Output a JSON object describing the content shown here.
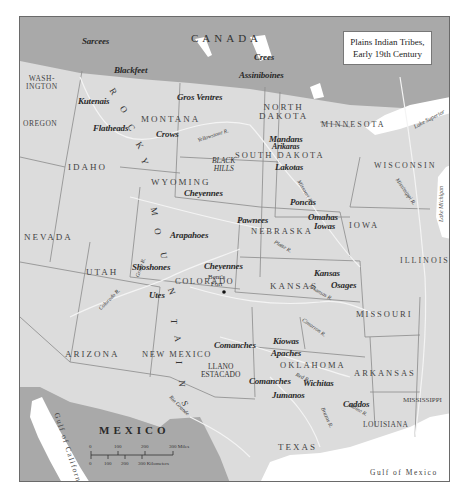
{
  "title": {
    "line1": "Plains Indian Tribes,",
    "line2": "Early 19th Century"
  },
  "countries": {
    "canada": "CANADA",
    "mexico": "MEXICO"
  },
  "states": {
    "washington_1": "WASH-",
    "washington_2": "INGTON",
    "oregon": "OREGON",
    "idaho": "IDAHO",
    "montana": "MONTANA",
    "north_dakota_1": "NORTH",
    "north_dakota_2": "DAKOTA",
    "south_dakota": "SOUTH DAKOTA",
    "minnesota": "MINNESOTA",
    "wisconsin": "WISCONSIN",
    "wyoming": "WYOMING",
    "nebraska": "NEBRASKA",
    "iowa": "IOWA",
    "illinois": "ILLINOIS",
    "nevada": "NEVADA",
    "utah": "UTAH",
    "colorado": "COLORADO",
    "kansas": "KANSAS",
    "missouri": "MISSOURI",
    "arizona": "ARIZONA",
    "new_mexico": "NEW MEXICO",
    "oklahoma": "OKLAHOMA",
    "arkansas": "ARKANSAS",
    "mississippi": "MISSISSIPPI",
    "louisiana": "LOUISIANA",
    "texas": "TEXAS"
  },
  "tribes": {
    "sarcees": "Sarcees",
    "blackfeet": "Blackfeet",
    "crees": "Crees",
    "assiniboines": "Assiniboines",
    "kutenais": "Kutenais",
    "gros_ventres": "Gros Ventres",
    "flatheads": "Flatheads",
    "crows": "Crows",
    "mandans": "Mandans",
    "arikaras": "Arikaras",
    "lakotas": "Lakotas",
    "cheyennes_n": "Cheyennes",
    "poncas": "Poncas",
    "pawnees": "Pawnees",
    "omahas": "Omahas",
    "iowas": "Iowas",
    "arapahoes": "Arapahoes",
    "shoshones": "Shoshones",
    "cheyennes_s": "Cheyennes",
    "utes": "Utes",
    "kansas": "Kansas",
    "osages": "Osages",
    "kiowas": "Kiowas",
    "apaches": "Apaches",
    "comanches_n": "Comanches",
    "comanches_s": "Comanches",
    "wichitas": "Wichitas",
    "jumanos": "Jumanos",
    "caddos": "Caddos"
  },
  "places": {
    "black_hills_1": "BLACK",
    "black_hills_2": "HILLS",
    "bents_fort_1": "Bent's",
    "bents_fort_2": "Fort",
    "llano_1": "LLANO",
    "llano_2": "ESTACADO"
  },
  "rocky_mountains": [
    "R",
    "O",
    "C",
    "K",
    "Y",
    "M",
    "O",
    "U",
    "N",
    "T",
    "A",
    "I",
    "N",
    "S"
  ],
  "rivers": {
    "yellowstone": "Yellowstone R.",
    "missouri": "Missouri R.",
    "mississippi": "Mississippi R.",
    "platte": "Platte R.",
    "green": "Green R.",
    "colorado": "Colorado R.",
    "arkansas": "Arkansas R.",
    "cimarron": "Cimarron R.",
    "red": "Red R.",
    "brazos": "Brazos R.",
    "sabine": "Sabine R.",
    "rio_grande": "Rio Grande"
  },
  "water_bodies": {
    "lake_superior": "Lake Superior",
    "lake_michigan": "Lake Michigan",
    "gulf_of_california": "Gulf of California",
    "gulf_of_mexico": "Gulf of Mexico"
  },
  "scale": {
    "miles": [
      "0",
      "100",
      "200",
      "300 Miles"
    ],
    "km": [
      "0",
      "100",
      "200",
      "300 Kilometers"
    ]
  },
  "colors": {
    "us_land": "#dcdcdc",
    "foreign_land": "#a9a9a9",
    "water": "#ffffff",
    "borders": "#8a8a8a",
    "rivers": "#f4f4f4"
  }
}
